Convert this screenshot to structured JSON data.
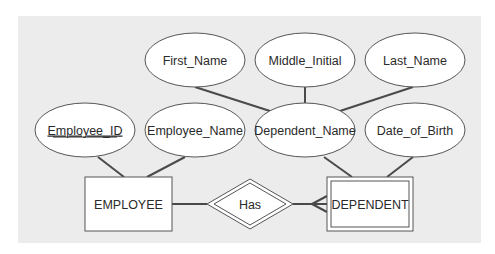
{
  "colors": {
    "page_bg": "#ffffff",
    "panel_bg": "#ececec",
    "shape_fill": "#ffffff",
    "stroke": "#555555",
    "line": "#4a4a4a",
    "text": "#2a2a2a"
  },
  "diagram": {
    "type": "ER diagram",
    "entities": [
      {
        "id": "employee",
        "label": "EMPLOYEE",
        "weak": false
      },
      {
        "id": "dependent",
        "label": "DEPENDENT",
        "weak": true
      }
    ],
    "relationships": [
      {
        "id": "has",
        "label": "Has",
        "identifying": true,
        "from": "EMPLOYEE",
        "to": "DEPENDENT",
        "to_cardinality": "many"
      }
    ],
    "attributes": {
      "first_name": {
        "label": "First_Name",
        "of": "Dependent_Name"
      },
      "middle_initial": {
        "label": "Middle_Initial",
        "of": "Dependent_Name"
      },
      "last_name": {
        "label": "Last_Name",
        "of": "Dependent_Name"
      },
      "employee_id": {
        "label": "Employee_ID",
        "of": "EMPLOYEE",
        "key": true
      },
      "employee_name": {
        "label": "Employee_Name",
        "of": "EMPLOYEE"
      },
      "dependent_name": {
        "label": "Dependent_Name",
        "of": "DEPENDENT",
        "composite": true
      },
      "date_of_birth": {
        "label": "Date_of_Birth",
        "of": "DEPENDENT"
      }
    }
  }
}
